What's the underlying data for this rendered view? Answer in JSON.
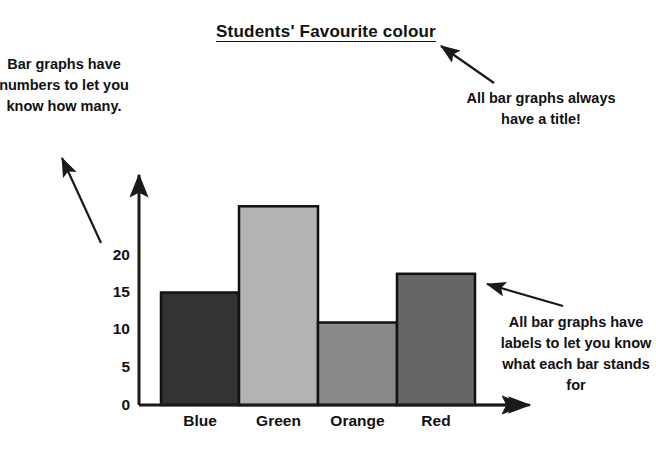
{
  "chart_data": {
    "type": "bar",
    "title": "Students' Favourite colour",
    "categories": [
      "Blue",
      "Green",
      "Orange",
      "Red"
    ],
    "values": [
      15,
      26.5,
      11,
      17.5
    ],
    "xlabel": "",
    "ylabel": "",
    "ylim": [
      0,
      27.5
    ],
    "yticks": [
      0,
      5,
      10,
      15,
      20
    ],
    "grid": false,
    "legend": false,
    "bar_colors": [
      "#333333",
      "#b3b3b3",
      "#8a8a8a",
      "#666666"
    ],
    "axis_color": "#1a1a1a",
    "bar_outline_color": "#111111"
  },
  "annotations": {
    "numbers_note": "Bar graphs have numbers to let you know how many.",
    "title_note": "All bar graphs always have a title!",
    "labels_note": "All bar graphs have labels to let you know what each bar stands for"
  },
  "ticks": {
    "t0": "0",
    "t1": "5",
    "t2": "10",
    "t3": "15",
    "t4": "20"
  },
  "categories": {
    "c0": "Blue",
    "c1": "Green",
    "c2": "Orange",
    "c3": "Red"
  }
}
